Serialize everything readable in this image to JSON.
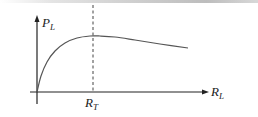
{
  "diagram": {
    "type": "power-vs-load-resistance curve",
    "y_axis": {
      "label": "P",
      "subscript": "L"
    },
    "x_axis": {
      "label": "R",
      "subscript": "L"
    },
    "marker": {
      "label": "R",
      "subscript": "T",
      "style": "dashed vertical line at peak"
    },
    "curve": {
      "description": "rises steeply from origin, reaches maximum at R_T, then decreases slowly",
      "points": [
        [
          37,
          92
        ],
        [
          41,
          76
        ],
        [
          47,
          62
        ],
        [
          55,
          51
        ],
        [
          65,
          43
        ],
        [
          77,
          38
        ],
        [
          90,
          36
        ],
        [
          100,
          36
        ],
        [
          115,
          37
        ],
        [
          135,
          40
        ],
        [
          160,
          44
        ],
        [
          188,
          48
        ]
      ]
    },
    "colors": {
      "line": "#555555",
      "axis": "#222222",
      "text": "#222222"
    }
  }
}
